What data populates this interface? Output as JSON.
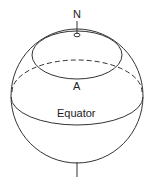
{
  "diagram": {
    "labels": {
      "north": "N",
      "latitude_point": "A",
      "equator": "Equator"
    },
    "colors": {
      "stroke": "#333333",
      "background": "#ffffff"
    }
  }
}
